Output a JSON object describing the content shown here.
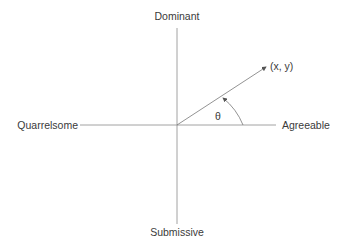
{
  "diagram": {
    "type": "interpersonal-circumplex",
    "axes": {
      "top": "Dominant",
      "bottom": "Submissive",
      "left": "Quarrelsome",
      "right": "Agreeable"
    },
    "vector_label": "(x, y)",
    "angle_label": "θ",
    "line_color": "#7a7a7a",
    "text_color": "#3a3a3a"
  }
}
